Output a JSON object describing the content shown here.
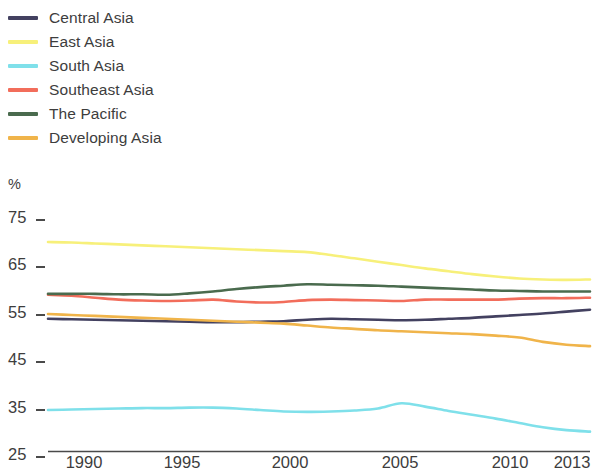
{
  "legend": {
    "items": [
      {
        "label": "Central Asia",
        "color": "#434160"
      },
      {
        "label": "East Asia",
        "color": "#f7f07a"
      },
      {
        "label": "South Asia",
        "color": "#7fe0ea"
      },
      {
        "label": "Southeast Asia",
        "color": "#f26d5b"
      },
      {
        "label": "The Pacific",
        "color": "#4a6b4e"
      },
      {
        "label": "Developing Asia",
        "color": "#f0b44a"
      }
    ]
  },
  "axis": {
    "unit": "%",
    "y_ticks": [
      "75",
      "65",
      "55",
      "45",
      "35",
      "25"
    ],
    "x_ticks": [
      "1990",
      "1995",
      "2000",
      "2005",
      "2010",
      "2013"
    ]
  },
  "chart_data": {
    "type": "line",
    "title": "",
    "xlabel": "",
    "ylabel": "%",
    "xlim": [
      1990,
      2013
    ],
    "ylim": [
      25,
      75
    ],
    "grid": false,
    "legend_position": "top-left",
    "x": [
      1990,
      1991,
      1992,
      1993,
      1994,
      1995,
      1996,
      1997,
      1998,
      1999,
      2000,
      2001,
      2002,
      2003,
      2004,
      2005,
      2006,
      2007,
      2008,
      2009,
      2010,
      2011,
      2012,
      2013
    ],
    "series": [
      {
        "name": "Central Asia",
        "color": "#434160",
        "values": [
          54.0,
          53.9,
          53.8,
          53.7,
          53.6,
          53.5,
          53.4,
          53.3,
          53.3,
          53.4,
          53.5,
          53.8,
          54.0,
          53.9,
          53.8,
          53.7,
          53.8,
          54.0,
          54.2,
          54.5,
          54.8,
          55.1,
          55.5,
          55.9
        ]
      },
      {
        "name": "East Asia",
        "color": "#f7f07a",
        "values": [
          70.0,
          69.9,
          69.7,
          69.5,
          69.3,
          69.1,
          68.9,
          68.7,
          68.5,
          68.3,
          68.1,
          67.9,
          67.3,
          66.6,
          65.9,
          65.2,
          64.5,
          63.9,
          63.3,
          62.8,
          62.4,
          62.2,
          62.1,
          62.2
        ]
      },
      {
        "name": "South Asia",
        "color": "#7fe0ea",
        "values": [
          35.0,
          35.1,
          35.2,
          35.3,
          35.4,
          35.4,
          35.5,
          35.5,
          35.3,
          35.0,
          34.7,
          34.6,
          34.7,
          34.9,
          35.3,
          36.4,
          35.7,
          34.8,
          34.0,
          33.2,
          32.3,
          31.4,
          30.8,
          30.5
        ]
      },
      {
        "name": "Southeast Asia",
        "color": "#f26d5b",
        "values": [
          59.0,
          58.8,
          58.4,
          58.0,
          57.8,
          57.7,
          57.8,
          58.0,
          57.6,
          57.4,
          57.5,
          57.9,
          58.0,
          57.9,
          57.8,
          57.7,
          58.0,
          58.0,
          58.0,
          58.0,
          58.2,
          58.3,
          58.3,
          58.4
        ]
      },
      {
        "name": "The Pacific",
        "color": "#4a6b4e",
        "values": [
          59.2,
          59.2,
          59.2,
          59.1,
          59.1,
          59.0,
          59.3,
          59.7,
          60.2,
          60.6,
          60.9,
          61.2,
          61.1,
          61.0,
          60.9,
          60.7,
          60.5,
          60.3,
          60.1,
          59.9,
          59.8,
          59.7,
          59.7,
          59.7
        ]
      },
      {
        "name": "Developing Asia",
        "color": "#f0b44a",
        "values": [
          55.0,
          54.8,
          54.6,
          54.4,
          54.2,
          54.0,
          53.8,
          53.6,
          53.4,
          53.2,
          53.0,
          52.6,
          52.2,
          51.9,
          51.6,
          51.4,
          51.2,
          51.0,
          50.8,
          50.5,
          50.1,
          49.2,
          48.6,
          48.3
        ]
      }
    ]
  }
}
